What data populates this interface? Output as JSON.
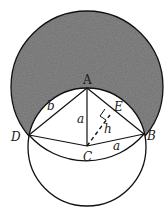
{
  "diagram": {
    "colors": {
      "shade": "#6e6e6e",
      "stroke": "#111111",
      "background": "#ffffff"
    },
    "points": {
      "A": {
        "label": "A",
        "x": 87,
        "y": 88
      },
      "B": {
        "label": "B",
        "x": 144,
        "y": 134
      },
      "C": {
        "label": "C",
        "x": 87,
        "y": 146
      },
      "D": {
        "label": "D",
        "x": 29,
        "y": 135
      },
      "E": {
        "label": "E",
        "x": 112,
        "y": 113
      }
    },
    "segment_labels": {
      "AD": "b",
      "AC": "a",
      "CB": "a",
      "CE": "h"
    },
    "circles": [
      {
        "name": "large-circle",
        "center": "A",
        "radius": 76,
        "shaded": true
      },
      {
        "name": "small-circle",
        "center": "C",
        "radius": 59,
        "shaded": false
      }
    ]
  }
}
